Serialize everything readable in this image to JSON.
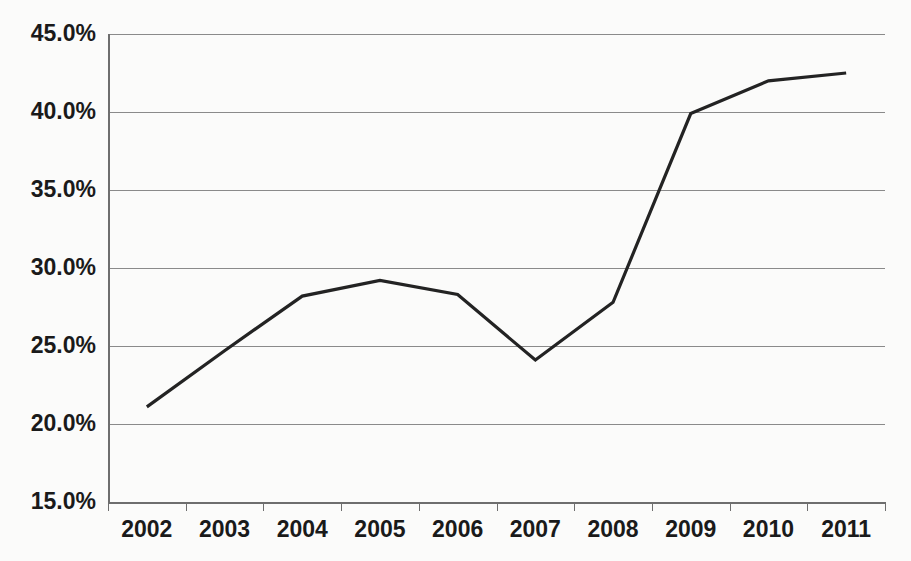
{
  "chart_data": {
    "type": "line",
    "title": "",
    "subtitle": "",
    "xlabel": "",
    "ylabel": "",
    "categories": [
      "2002",
      "2003",
      "2004",
      "2005",
      "2006",
      "2007",
      "2008",
      "2009",
      "2010",
      "2011"
    ],
    "values": [
      21.1,
      24.7,
      28.2,
      29.2,
      28.3,
      24.1,
      27.8,
      39.9,
      42.0,
      42.5
    ],
    "series": [
      {
        "name": "series-1",
        "values": [
          21.1,
          24.7,
          28.2,
          29.2,
          28.3,
          24.1,
          27.8,
          39.9,
          42.0,
          42.5
        ],
        "color": "#232323"
      }
    ],
    "ylim": [
      15.0,
      45.0
    ],
    "ytick_values": [
      15.0,
      20.0,
      25.0,
      30.0,
      35.0,
      40.0,
      45.0
    ],
    "ytick_labels": [
      "15.0%",
      "20.0%",
      "25.0%",
      "30.0%",
      "35.0%",
      "40.0%",
      "45.0%"
    ],
    "xtick_labels": [
      "2002",
      "2003",
      "2004",
      "2005",
      "2006",
      "2007",
      "2008",
      "2009",
      "2010",
      "2011"
    ],
    "grid": true,
    "grid_axis": "y",
    "legend": false,
    "legend_position": "none",
    "markers": false,
    "value_suffix": "%",
    "annotations": []
  },
  "colors": {
    "background": "#fbfbfa",
    "plot_background": "#fbfbfa",
    "gridline": "#8a8a8a",
    "axis": "#6e6e6e",
    "line": "#232323",
    "tick_text": "#1a1a1a"
  },
  "geometry": {
    "plot_left": 108,
    "plot_right": 885,
    "plot_top": 34,
    "plot_bottom": 502
  }
}
